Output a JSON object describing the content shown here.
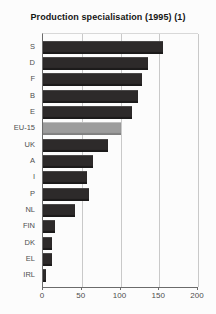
{
  "chart_data": {
    "type": "bar",
    "orientation": "horizontal",
    "title": "Production specialisation (1995) (1)",
    "categories": [
      "S",
      "D",
      "F",
      "B",
      "E",
      "EU-15",
      "UK",
      "A",
      "I",
      "P",
      "NL",
      "FIN",
      "DK",
      "EL",
      "IRL"
    ],
    "values": [
      155,
      135,
      128,
      122,
      115,
      100,
      84,
      64,
      57,
      59,
      41,
      15,
      12,
      11,
      4
    ],
    "highlight_category": "EU-15",
    "xlabel": "",
    "ylabel": "",
    "xlim": [
      0,
      200
    ],
    "x_ticks": [
      0,
      50,
      100,
      150,
      200
    ],
    "grid": "vertical",
    "legend": "none"
  },
  "colors": {
    "background": "#fcfcfc",
    "bar": "#2d2a2a",
    "bar_highlight": "#9c9c9c",
    "grid": "#c9c9c9",
    "axis": "#6b6b6b",
    "plot_border": "#d8d8d8",
    "title_text": "#151515",
    "label_text": "#4e4e4e",
    "tick_text": "#4e4e4e"
  }
}
